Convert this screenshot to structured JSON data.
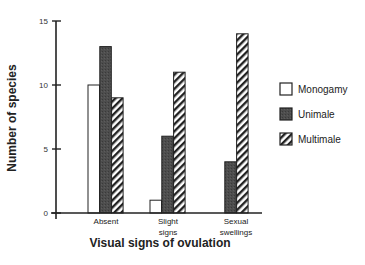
{
  "chart_data": {
    "type": "bar",
    "title": "",
    "xlabel": "Visual signs of ovulation",
    "ylabel": "Number of species",
    "ylim": [
      0,
      15
    ],
    "yticks": [
      0,
      5,
      10,
      15
    ],
    "grid": false,
    "legend_position": "right",
    "categories": [
      {
        "label_lines": [
          "Absent"
        ]
      },
      {
        "label_lines": [
          "Slight",
          "signs"
        ]
      },
      {
        "label_lines": [
          "Sexual",
          "swellings"
        ]
      }
    ],
    "category_names": [
      "Absent",
      "Slight signs",
      "Sexual swellings"
    ],
    "series": [
      {
        "name": "Monogamy",
        "style": "white",
        "values": [
          10,
          1,
          0
        ]
      },
      {
        "name": "Unimale",
        "style": "dark",
        "values": [
          13,
          6,
          4
        ]
      },
      {
        "name": "Multimale",
        "style": "hatched",
        "values": [
          9,
          11,
          14
        ]
      }
    ]
  },
  "colors": {
    "axis": "#222222",
    "monogamy_fill": "#ffffff",
    "unimale_fill": "#4a4a4a",
    "hatch_line": "#222222"
  }
}
